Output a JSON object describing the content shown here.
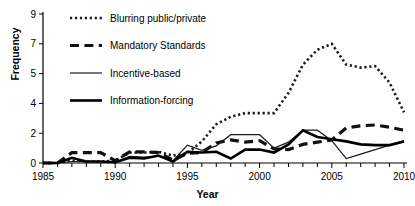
{
  "chart_data": {
    "type": "line",
    "title": "",
    "xlabel": "Year",
    "ylabel": "Frequency",
    "xlim": [
      1985,
      2010
    ],
    "ylim": [
      0,
      9
    ],
    "grid": false,
    "legend_position": "top-left",
    "y_ticks": [
      0,
      2,
      4,
      5,
      7,
      9
    ],
    "y_tick_labels": [
      "0",
      "2",
      "4",
      "5",
      "7",
      "9"
    ],
    "x_ticks": [
      1985,
      1986,
      1987,
      1988,
      1989,
      1990,
      1991,
      1992,
      1993,
      1994,
      1995,
      1996,
      1997,
      1998,
      1999,
      2000,
      2001,
      2002,
      2003,
      2004,
      2005,
      2006,
      2007,
      2008,
      2009,
      2010
    ],
    "x_tick_labels": [
      "1985",
      "",
      "",
      "",
      "",
      "1990",
      "",
      "",
      "",
      "",
      "1995",
      "",
      "",
      "",
      "",
      "2000",
      "",
      "",
      "",
      "",
      "2005",
      "",
      "",
      "",
      "",
      "2010"
    ],
    "x": [
      1985,
      1986,
      1987,
      1988,
      1989,
      1990,
      1991,
      1992,
      1993,
      1994,
      1995,
      1996,
      1997,
      1998,
      1999,
      2000,
      2001,
      2002,
      2003,
      2004,
      2005,
      2006,
      2007,
      2008,
      2009,
      2010
    ],
    "series": [
      {
        "name": "Blurring public/private",
        "style": "dotted",
        "width": 2.6,
        "color": "#1a1a1a",
        "values": [
          0,
          0,
          0.15,
          0.1,
          0.1,
          0.15,
          0.7,
          0.7,
          0.75,
          0.5,
          0.65,
          1.45,
          2.6,
          3.1,
          3.35,
          3.35,
          3.35,
          4.35,
          5.6,
          6.6,
          7.0,
          5.6,
          5.4,
          5.5,
          4.7,
          3.4
        ]
      },
      {
        "name": "Mandatory Standards",
        "style": "dashed",
        "width": 3.2,
        "color": "#111111",
        "values": [
          0,
          0,
          0.7,
          0.7,
          0.7,
          0.15,
          0.75,
          0.75,
          0.7,
          0.2,
          0.65,
          0.7,
          1.35,
          1.55,
          1.4,
          1.5,
          0.95,
          0.9,
          1.25,
          1.4,
          1.55,
          2.35,
          2.5,
          2.55,
          2.4,
          2.2
        ]
      },
      {
        "name": "Incentive-based",
        "style": "solid-thin",
        "width": 1.2,
        "color": "#1a1a1a",
        "values": [
          0,
          0,
          0.1,
          0.1,
          0.1,
          0.05,
          0.45,
          0.4,
          0.45,
          0.15,
          1.2,
          0.85,
          1.15,
          1.9,
          1.9,
          1.9,
          1.0,
          1.4,
          2.2,
          2.2,
          1.5,
          0.3,
          0.6,
          0.9,
          1.2,
          1.5
        ]
      },
      {
        "name": "Information-forcing",
        "style": "solid-thick",
        "width": 2.6,
        "color": "#000000",
        "values": [
          0,
          0,
          0.35,
          0.1,
          0.1,
          0.05,
          0.35,
          0.3,
          0.5,
          0.1,
          0.75,
          0.7,
          0.75,
          0.3,
          0.9,
          0.9,
          0.7,
          1.25,
          2.2,
          1.75,
          1.6,
          1.45,
          1.25,
          1.2,
          1.2,
          1.45
        ]
      }
    ]
  },
  "axis": {
    "ylabel": "Frequency",
    "xlabel": "Year"
  },
  "legend": {
    "items": [
      {
        "label": "Blurring public/private",
        "swatch": "dotted"
      },
      {
        "label": "Mandatory Standards",
        "swatch": "dashed"
      },
      {
        "label": "Incentive-based",
        "swatch": "solid-thin"
      },
      {
        "label": "Information-forcing",
        "swatch": "solid-thick"
      }
    ]
  }
}
